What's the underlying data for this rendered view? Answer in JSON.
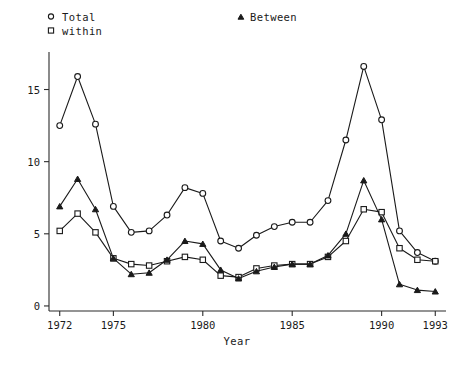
{
  "chart_data": {
    "type": "line",
    "title": "",
    "xlabel": "Year",
    "ylabel": "",
    "xlim": [
      1971.4,
      1993.6
    ],
    "ylim": [
      -0.35,
      17.6
    ],
    "grid": false,
    "legend_position": "top",
    "xticks": [
      1972,
      1975,
      1980,
      1985,
      1990,
      1993
    ],
    "xticklabels": [
      "1972",
      "1975",
      "1980",
      "1985",
      "1990",
      "1993"
    ],
    "yticks": [
      0,
      5,
      10,
      15
    ],
    "yticklabels": [
      "0",
      "5",
      "10",
      "15"
    ],
    "x": [
      1972,
      1973,
      1974,
      1975,
      1976,
      1977,
      1978,
      1979,
      1980,
      1981,
      1982,
      1983,
      1984,
      1985,
      1986,
      1987,
      1988,
      1989,
      1990,
      1991,
      1992,
      1993
    ],
    "series": [
      {
        "name": "Total",
        "marker": "circle",
        "values": [
          12.5,
          15.9,
          12.6,
          6.9,
          5.1,
          5.2,
          6.3,
          8.2,
          7.8,
          4.5,
          4.0,
          4.9,
          5.5,
          5.8,
          5.8,
          7.3,
          11.5,
          16.6,
          12.9,
          5.2,
          3.7,
          3.1
        ]
      },
      {
        "name": "within",
        "marker": "square",
        "values": [
          5.2,
          6.4,
          5.1,
          3.3,
          2.9,
          2.8,
          3.1,
          3.4,
          3.2,
          2.1,
          2.0,
          2.6,
          2.8,
          2.9,
          2.9,
          3.4,
          4.5,
          6.7,
          6.5,
          4.0,
          3.2,
          3.1
        ]
      },
      {
        "name": "Between",
        "marker": "triangle",
        "values": [
          6.9,
          8.8,
          6.7,
          3.3,
          2.2,
          2.3,
          3.2,
          4.5,
          4.3,
          2.5,
          1.9,
          2.4,
          2.7,
          2.9,
          2.9,
          3.5,
          5.0,
          8.7,
          6.0,
          1.5,
          1.1,
          1.0
        ]
      }
    ],
    "legend_entries": [
      {
        "label": "Total",
        "marker": "circle"
      },
      {
        "label": "within",
        "marker": "square"
      },
      {
        "label": "Between",
        "marker": "triangle"
      }
    ],
    "colors": {
      "ink": "#1a1a1a",
      "background": "#ffffff"
    }
  }
}
